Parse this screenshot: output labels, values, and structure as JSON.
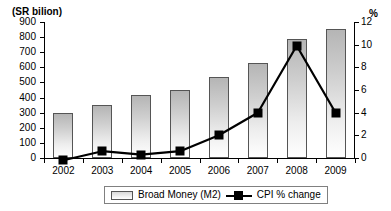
{
  "chart_data": {
    "type": "bar",
    "title": "",
    "subtitle": "",
    "categories": [
      "2002",
      "2003",
      "2004",
      "2005",
      "2006",
      "2007",
      "2008",
      "2009"
    ],
    "xlabel": "",
    "ylabel": "(SR bilion)",
    "ylabel_right": "%",
    "ylim": [
      0,
      900
    ],
    "ylim_right": [
      0,
      12
    ],
    "yticks": [
      "900",
      "800",
      "700",
      "600",
      "500",
      "400",
      "300",
      "200",
      "100",
      "0"
    ],
    "yticks_right": [
      "12",
      "10",
      "8",
      "6",
      "4",
      "2",
      "0"
    ],
    "grid": false,
    "legend_position": "bottom",
    "series": [
      {
        "name": "Broad Money (M2)",
        "type": "bar",
        "axis": "left",
        "unit": "SR billion",
        "values": [
          300,
          350,
          420,
          450,
          535,
          630,
          790,
          855
        ]
      },
      {
        "name": "CPI % change",
        "type": "line",
        "axis": "right",
        "unit": "%",
        "values": [
          -0.2,
          0.6,
          0.3,
          0.6,
          2.0,
          4.0,
          9.9,
          4.0
        ]
      }
    ],
    "legend": [
      {
        "label": "Broad Money (M2)",
        "marker": "bar-swatch",
        "color": "#cccccc"
      },
      {
        "label": "CPI % change",
        "marker": "line-square",
        "color": "#000000"
      }
    ],
    "colors": {
      "bar_fill_top": "#b5b5b5",
      "bar_fill_bottom": "#ffffff",
      "bar_border": "#555555",
      "line": "#000000",
      "axis": "#000000",
      "background": "#ffffff"
    }
  }
}
